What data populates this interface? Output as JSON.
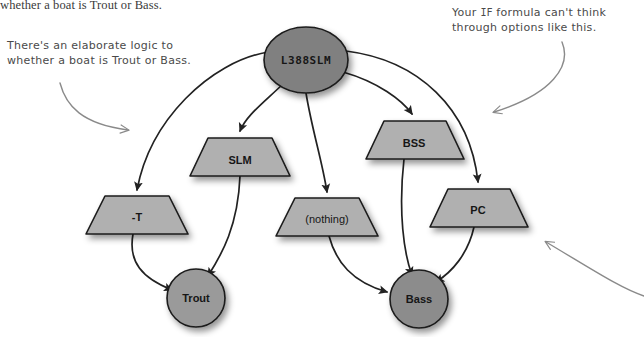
{
  "page": {
    "body_text_fragment": "whether a boat is Trout or Bass.",
    "width": 644,
    "height": 337,
    "background": "#ffffff"
  },
  "annotations": [
    {
      "id": "left-annotation",
      "line1": "There's an elaborate logic to",
      "line2": "whether a boat is Trout or Bass."
    },
    {
      "id": "right-annotation",
      "prefix": "Your ",
      "mono": "IF",
      "suffix": " formula can't think",
      "line2": "through options like this."
    }
  ],
  "colors": {
    "node_fill_dark": "#808080",
    "node_fill_light": "#b0b0b0",
    "node_stroke": "#1a1a1a",
    "edge_stroke": "#222222",
    "annotation_stroke": "#7a7a7a",
    "text_dark": "#161616",
    "shadow": "rgba(0,0,0,0.35)"
  },
  "diagram": {
    "type": "flowchart",
    "nodes": [
      {
        "id": "root",
        "label": "L388SLM",
        "shape": "circle",
        "font": "mono",
        "cx": 306,
        "cy": 60,
        "rx": 42,
        "ry": 33,
        "fill": "#808080"
      },
      {
        "id": "slm",
        "label": "SLM",
        "shape": "trapezoid",
        "font": "sans",
        "cx": 240,
        "cy": 157,
        "w": 92,
        "h": 38,
        "fill": "#b0b0b0"
      },
      {
        "id": "bss",
        "label": "BSS",
        "shape": "trapezoid",
        "font": "sans",
        "cx": 414,
        "cy": 140,
        "w": 92,
        "h": 38,
        "fill": "#b0b0b0"
      },
      {
        "id": "minus-t",
        "label": "-T",
        "shape": "trapezoid",
        "font": "sans",
        "cx": 137,
        "cy": 215,
        "w": 100,
        "h": 38,
        "fill": "#b0b0b0"
      },
      {
        "id": "nothing",
        "label": "(nothing)",
        "shape": "trapezoid",
        "font": "regular",
        "cx": 327,
        "cy": 217,
        "w": 100,
        "h": 38,
        "fill": "#b0b0b0"
      },
      {
        "id": "pc",
        "label": "PC",
        "shape": "trapezoid",
        "font": "sans",
        "cx": 478,
        "cy": 208,
        "w": 92,
        "h": 38,
        "fill": "#b0b0b0"
      },
      {
        "id": "trout",
        "label": "Trout",
        "shape": "circle",
        "font": "sans",
        "cx": 196,
        "cy": 298,
        "rx": 29,
        "ry": 29,
        "fill": "#9a9a9a"
      },
      {
        "id": "bass",
        "label": "Bass",
        "shape": "circle",
        "font": "sans",
        "cx": 419,
        "cy": 299,
        "rx": 29,
        "ry": 29,
        "fill": "#8c8c8c"
      }
    ],
    "edges": [
      {
        "from": "root",
        "to": "minus-t"
      },
      {
        "from": "root",
        "to": "slm"
      },
      {
        "from": "root",
        "to": "nothing"
      },
      {
        "from": "root",
        "to": "bss"
      },
      {
        "from": "root",
        "to": "pc"
      },
      {
        "from": "minus-t",
        "to": "trout"
      },
      {
        "from": "slm",
        "to": "trout"
      },
      {
        "from": "nothing",
        "to": "bass"
      },
      {
        "from": "bss",
        "to": "bass"
      },
      {
        "from": "pc",
        "to": "bass"
      }
    ]
  }
}
